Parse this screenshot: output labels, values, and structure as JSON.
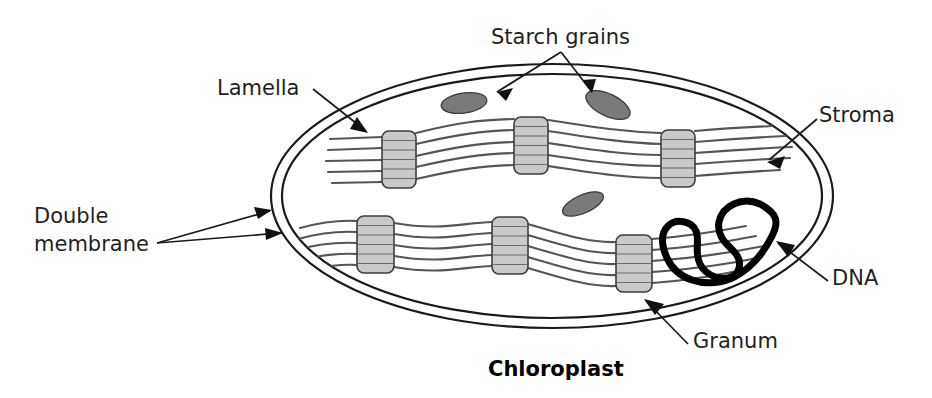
{
  "diagram": {
    "title": "Chloroplast",
    "title_bold": true,
    "background_color": "#ffffff",
    "labels": [
      {
        "id": "starch-grains",
        "text": "Starch grains",
        "x": 491,
        "y": 44,
        "anchor": "start"
      },
      {
        "id": "lamella",
        "text": "Lamella",
        "x": 217,
        "y": 95,
        "anchor": "start"
      },
      {
        "id": "stroma",
        "text": "Stroma",
        "x": 819,
        "y": 122,
        "anchor": "start"
      },
      {
        "id": "dna",
        "text": "DNA",
        "x": 832,
        "y": 285,
        "anchor": "start"
      },
      {
        "id": "granum",
        "text": "Granum",
        "x": 693,
        "y": 348,
        "anchor": "start"
      },
      {
        "id": "double-membrane-line1",
        "text": "Double",
        "x": 34,
        "y": 223,
        "anchor": "start"
      },
      {
        "id": "double-membrane-line2",
        "text": "membrane",
        "x": 34,
        "y": 251,
        "anchor": "start"
      },
      {
        "id": "chloroplast-title",
        "text": "Chloroplast",
        "x": 488,
        "y": 376,
        "anchor": "start"
      }
    ],
    "parts": {
      "outer_membrane": "outer-membrane-ellipse",
      "inner_membrane": "inner-membrane-ellipse",
      "grana_count": 6,
      "starch_grain_count": 3,
      "lamella_rows": 2,
      "lamella_lines_per_row": 5
    },
    "colors": {
      "membrane_stroke": "#1a1a1a",
      "granum_fill": "#c9c9c9",
      "granum_stroke": "#3d3d3d",
      "lamella_stroke": "#555555",
      "starch_fill": "#7a7a7a",
      "dna_stroke": "#000000",
      "text": "#231f20"
    },
    "grana": [
      {
        "id": "granum-top-1",
        "x": 382,
        "y": 131,
        "w": 34,
        "h": 57,
        "bands": 6
      },
      {
        "id": "granum-top-2",
        "x": 514,
        "y": 117,
        "w": 34,
        "h": 57,
        "bands": 6
      },
      {
        "id": "granum-top-3",
        "x": 661,
        "y": 130,
        "w": 34,
        "h": 57,
        "bands": 6
      },
      {
        "id": "granum-bottom-1",
        "x": 357,
        "y": 216,
        "w": 37,
        "h": 57,
        "bands": 6
      },
      {
        "id": "granum-bottom-2",
        "x": 492,
        "y": 217,
        "w": 36,
        "h": 57,
        "bands": 6
      },
      {
        "id": "granum-bottom-3",
        "x": 616,
        "y": 235,
        "w": 36,
        "h": 57,
        "bands": 6
      }
    ],
    "starch_grains": [
      {
        "id": "starch-grain-left",
        "cx": 464,
        "cy": 103,
        "rx": 23,
        "ry": 10,
        "rotate": -8
      },
      {
        "id": "starch-grain-right",
        "cx": 608,
        "cy": 105,
        "rx": 24,
        "ry": 11,
        "rotate": 26
      },
      {
        "id": "starch-grain-middle",
        "cx": 583,
        "cy": 204,
        "rx": 22,
        "ry": 9,
        "rotate": -24
      }
    ]
  }
}
